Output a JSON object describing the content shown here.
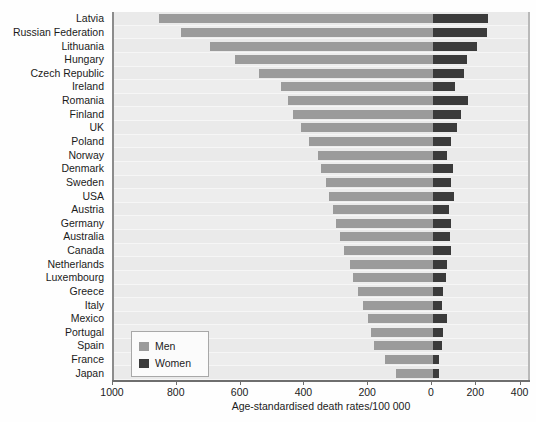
{
  "chart_data": {
    "type": "bar",
    "orientation": "horizontal",
    "style": "back-to-back population pyramid",
    "title": "",
    "subtitle": "",
    "xlabel": "Age-standardised death rates/100 000",
    "ylabel": "",
    "grid": true,
    "legend_position": "bottom-left inside plot",
    "x_ticks_left": [
      "1000",
      "800",
      "600",
      "400",
      "200"
    ],
    "x_tick_zero": "0",
    "x_ticks_right": [
      "200",
      "400"
    ],
    "x_tick_labels": [
      "1000",
      "800",
      "600",
      "400",
      "200",
      "0",
      "200",
      "400"
    ],
    "xlim_left": [
      0,
      1000
    ],
    "xlim_right": [
      0,
      400
    ],
    "categories": [
      "Latvia",
      "Russian Federation",
      "Lithuania",
      "Hungary",
      "Czech Republic",
      "Ireland",
      "Romania",
      "Finland",
      "UK",
      "Poland",
      "Norway",
      "Denmark",
      "Sweden",
      "USA",
      "Austria",
      "Germany",
      "Australia",
      "Canada",
      "Netherlands",
      "Luxembourg",
      "Greece",
      "Italy",
      "Mexico",
      "Portugal",
      "Spain",
      "France",
      "Japan"
    ],
    "series": [
      {
        "name": "Men",
        "color": "#9b9b9b",
        "direction": "left",
        "values": [
          860,
          790,
          700,
          620,
          545,
          475,
          455,
          440,
          415,
          390,
          360,
          350,
          335,
          325,
          315,
          305,
          290,
          280,
          260,
          250,
          235,
          220,
          205,
          195,
          185,
          150,
          115
        ]
      },
      {
        "name": "Women",
        "color": "#3b3b3b",
        "direction": "right",
        "values": [
          250,
          243,
          200,
          155,
          140,
          100,
          160,
          125,
          110,
          80,
          65,
          90,
          80,
          95,
          70,
          80,
          75,
          80,
          65,
          60,
          45,
          40,
          65,
          45,
          40,
          25,
          25
        ]
      }
    ]
  },
  "legend": {
    "items": [
      {
        "label": "Men",
        "color": "#9b9b9b"
      },
      {
        "label": "Women",
        "color": "#3b3b3b"
      }
    ]
  },
  "axis": {
    "x_title": "Age-standardised death rates/100 000"
  },
  "colors": {
    "plot_background": "#e9e9e9",
    "row_band": "#ededed",
    "axis": "#6e6e6e",
    "men": "#9b9b9b",
    "women": "#3b3b3b",
    "text": "#1b1b1b"
  }
}
